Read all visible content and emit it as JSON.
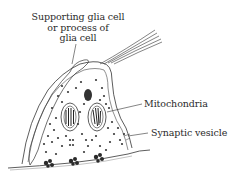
{
  "diagram": {
    "colors": {
      "background": "#ffffff",
      "ink": "#2a2a2a",
      "stipple": "#555555"
    },
    "labels": {
      "glia": {
        "line1": "Supporting glia cell",
        "line2": "or process of",
        "line3": "glia cell"
      },
      "mitochondria": "Mitochondria",
      "synaptic_vesicle": "Synaptic vesicle"
    }
  }
}
